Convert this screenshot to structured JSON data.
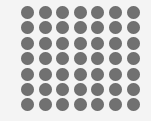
{
  "grid": {
    "rows": 7,
    "cols": 7,
    "dot_color": "#717171",
    "background_color": "#f4f4f4",
    "dot_diameter": 13,
    "col_step": 17.6,
    "row_step": 15.4
  }
}
